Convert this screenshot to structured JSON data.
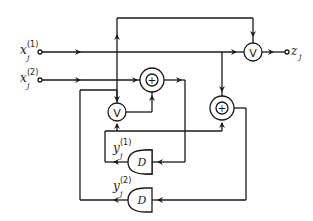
{
  "diagram": {
    "inputs": [
      {
        "id": "x1",
        "base": "x",
        "sup": "(1)",
        "sub": "j"
      },
      {
        "id": "x2",
        "base": "x",
        "sup": "(2)",
        "sub": "j"
      }
    ],
    "output": {
      "id": "z",
      "base": "z",
      "sub": "j"
    },
    "states": [
      {
        "id": "y1",
        "base": "y",
        "sup": "(1)",
        "sub": "j"
      },
      {
        "id": "y2",
        "base": "y",
        "sup": "(2)",
        "sub": "j"
      }
    ],
    "gates": {
      "or_symbol": "V",
      "xor_symbol": "+",
      "delay_symbol": "D"
    }
  }
}
